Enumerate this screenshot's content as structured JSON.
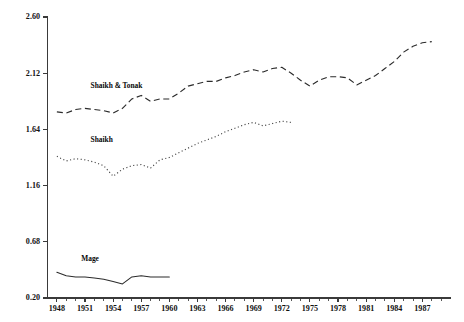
{
  "chart_data": {
    "type": "line",
    "title": "",
    "subtitle": "",
    "xlabel": "",
    "ylabel": "",
    "xlim": [
      1947,
      1990
    ],
    "ylim": [
      0.2,
      2.6
    ],
    "grid": false,
    "legend_position": "inline-annotations",
    "y_ticks": [
      "2.60",
      "2.12",
      "1.64",
      "1.16",
      "0.68",
      "0.20"
    ],
    "y_tick_values": [
      2.6,
      2.12,
      1.64,
      1.16,
      0.68,
      0.2
    ],
    "x_ticks": [
      "1948",
      "1951",
      "1954",
      "1957",
      "1960",
      "1963",
      "1966",
      "1969",
      "1972",
      "1975",
      "1978",
      "1981",
      "1984",
      "1987"
    ],
    "x_tick_values": [
      1948,
      1951,
      1954,
      1957,
      1960,
      1963,
      1966,
      1969,
      1972,
      1975,
      1978,
      1981,
      1984,
      1987
    ],
    "annotations": [
      {
        "text": "Shaikh & Tonak",
        "x": 1951.6,
        "y": 1.99,
        "series": "Shaikh & Tonak"
      },
      {
        "text": "Shaikh",
        "x": 1951.6,
        "y": 1.53,
        "series": "Shaikh"
      },
      {
        "text": "Mage",
        "x": 1950.6,
        "y": 0.52,
        "series": "Mage"
      }
    ],
    "series": [
      {
        "name": "Shaikh & Tonak",
        "style": "dashed",
        "color": "#2b2b2b",
        "x": [
          1948,
          1949,
          1950,
          1951,
          1952,
          1953,
          1954,
          1955,
          1956,
          1957,
          1958,
          1959,
          1960,
          1961,
          1962,
          1963,
          1964,
          1965,
          1966,
          1967,
          1968,
          1969,
          1970,
          1971,
          1972,
          1973,
          1974,
          1975,
          1976,
          1977,
          1978,
          1979,
          1980,
          1981,
          1982,
          1983,
          1984,
          1985,
          1986,
          1987,
          1988
        ],
        "values": [
          1.79,
          1.78,
          1.81,
          1.82,
          1.81,
          1.8,
          1.78,
          1.82,
          1.9,
          1.93,
          1.88,
          1.9,
          1.9,
          1.95,
          2.01,
          2.03,
          2.05,
          2.05,
          2.08,
          2.1,
          2.13,
          2.15,
          2.13,
          2.16,
          2.17,
          2.12,
          2.06,
          2.01,
          2.06,
          2.09,
          2.09,
          2.08,
          2.02,
          2.06,
          2.1,
          2.16,
          2.22,
          2.3,
          2.35,
          2.38,
          2.39
        ]
      },
      {
        "name": "Shaikh",
        "style": "dotted",
        "color": "#444444",
        "x": [
          1948,
          1949,
          1950,
          1951,
          1952,
          1953,
          1954,
          1955,
          1956,
          1957,
          1958,
          1959,
          1960,
          1961,
          1962,
          1963,
          1964,
          1965,
          1966,
          1967,
          1968,
          1969,
          1970,
          1971,
          1972,
          1973
        ],
        "values": [
          1.41,
          1.37,
          1.39,
          1.38,
          1.36,
          1.33,
          1.24,
          1.3,
          1.33,
          1.34,
          1.31,
          1.38,
          1.4,
          1.44,
          1.48,
          1.52,
          1.55,
          1.58,
          1.62,
          1.65,
          1.68,
          1.7,
          1.67,
          1.69,
          1.71,
          1.7
        ]
      },
      {
        "name": "Mage",
        "style": "solid",
        "color": "#2b2b2b",
        "x": [
          1948,
          1949,
          1950,
          1951,
          1952,
          1953,
          1954,
          1955,
          1956,
          1957,
          1958,
          1959,
          1960
        ],
        "values": [
          0.42,
          0.39,
          0.38,
          0.38,
          0.37,
          0.36,
          0.34,
          0.32,
          0.38,
          0.39,
          0.38,
          0.38,
          0.38
        ]
      }
    ]
  }
}
